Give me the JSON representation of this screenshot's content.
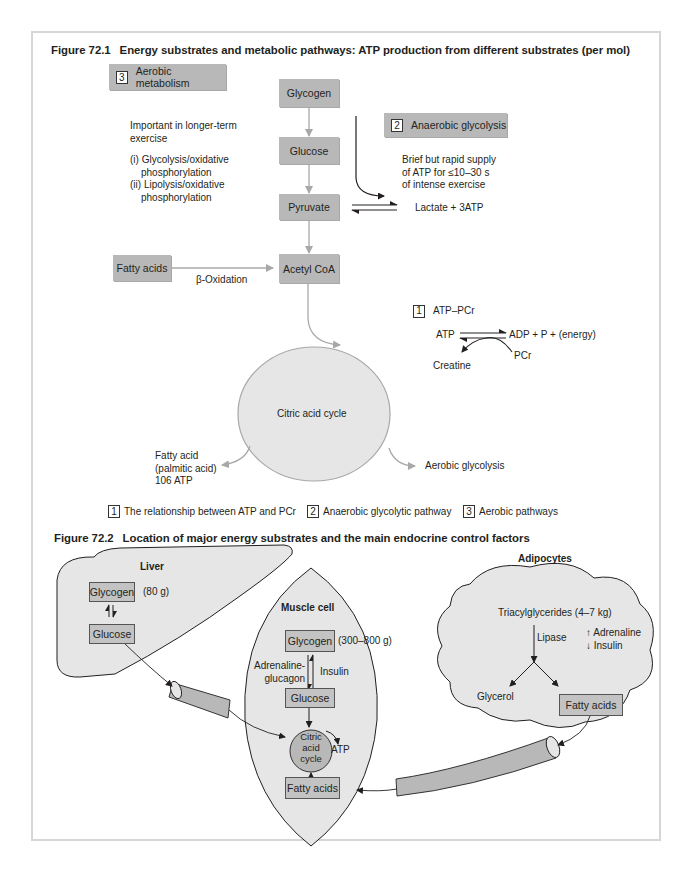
{
  "figure1": {
    "title_num": "Figure 72.1",
    "title": "Energy substrates and metabolic pathways: ATP production from different substrates (per mol)",
    "aerobic": {
      "num": "3",
      "label": "Aerobic metabolism",
      "desc_line1": "Important in longer-term",
      "desc_line2": "exercise",
      "item1_line1": "(i) Glycolysis/oxidative",
      "item1_line2": "phosphorylation",
      "item2_line1": "(ii) Lipolysis/oxidative",
      "item2_line2": "phosphorylation"
    },
    "pathway": {
      "glycogen": "Glycogen",
      "glucose": "Glucose",
      "pyruvate": "Pyruvate",
      "acetyl_coa": "Acetyl CoA",
      "fatty_acids": "Fatty acids",
      "beta_oxidation": "β-Oxidation",
      "citric_acid_cycle": "Citric acid cycle",
      "fatty_acid_line1": "Fatty acid",
      "fatty_acid_line2": "(palmitic acid)",
      "fatty_acid_line3": "106 ATP",
      "aerobic_glycolysis": "Aerobic glycolysis"
    },
    "anaerobic": {
      "num": "2",
      "label": "Anaerobic glycolysis",
      "desc_line1": "Brief but rapid supply",
      "desc_line2": "of ATP for ≤10–30 s",
      "desc_line3": "of intense exercise",
      "product": "Lactate + 3ATP"
    },
    "atp_pcr": {
      "num": "1",
      "label": "ATP–PCr",
      "atp": "ATP",
      "products": "ADP + P + (energy)",
      "pcr": "PCr",
      "creatine": "Creatine"
    },
    "legend": [
      {
        "num": "1",
        "label": "The relationship between ATP and PCr"
      },
      {
        "num": "2",
        "label": "Anaerobic glycolytic pathway"
      },
      {
        "num": "3",
        "label": "Aerobic pathways"
      }
    ]
  },
  "figure2": {
    "title_num": "Figure 72.2",
    "title": "Location of major energy substrates and the main endocrine control factors",
    "liver": {
      "label": "Liver",
      "glycogen": "Glycogen",
      "glycogen_amount": "(80 g)",
      "glucose": "Glucose"
    },
    "muscle": {
      "label": "Muscle cell",
      "glycogen": "Glycogen",
      "glycogen_amount": "(300–800 g)",
      "hormone_left_line1": "Adrenaline-",
      "hormone_left_line2": "glucagon",
      "hormone_right": "Insulin",
      "glucose": "Glucose",
      "cycle_line1": "Citric",
      "cycle_line2": "acid",
      "cycle_line3": "cycle",
      "atp": "ATP",
      "fatty_acids": "Fatty acids"
    },
    "adipocytes": {
      "label": "Adipocytes",
      "triacylglycerides": "Triacylglycerides (4–7 kg)",
      "lipase": "Lipase",
      "adrenaline": "↑ Adrenaline",
      "insulin": "↓ Insulin",
      "glycerol": "Glycerol",
      "fatty_acids": "Fatty acids"
    }
  },
  "colors": {
    "box_fill": "#b8b8b8",
    "shape_fill": "#e6e6e6",
    "arrow_gray": "#a8a8a8",
    "frame_border": "#d6d6d6",
    "text": "#231f20"
  }
}
